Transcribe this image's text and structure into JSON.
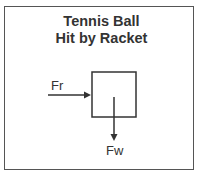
{
  "diagram": {
    "title_line1": "Tennis Ball",
    "title_line2": "Hit by Racket",
    "forces": [
      {
        "label": "Fr",
        "direction": "right"
      },
      {
        "label": "Fw",
        "direction": "down"
      }
    ],
    "colors": {
      "stroke": "#333333",
      "border": "#555555",
      "background": "#ffffff"
    }
  }
}
